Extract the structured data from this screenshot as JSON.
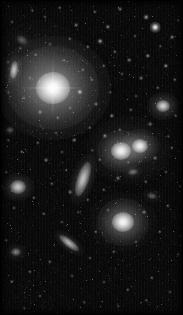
{
  "image": {
    "kind": "astronomical-deep-sky-image",
    "title": "Galaxy cluster field",
    "width": 183,
    "height": 315,
    "color_mode": "grayscale",
    "background_color": "#050505",
    "light_color": "#ffffff",
    "border_color": "#000000",
    "orientation_note": "dense stellar field with several extended galaxies"
  },
  "intracluster_light": [
    {
      "name": "halo-around-dominant-galaxy",
      "cx": 53,
      "cy": 88,
      "rx": 58,
      "ry": 52,
      "peak": 0.3
    },
    {
      "name": "halo-around-galaxy-pair",
      "cx": 128,
      "cy": 150,
      "rx": 42,
      "ry": 34,
      "peak": 0.15
    },
    {
      "name": "halo-around-lower-elliptical",
      "cx": 123,
      "cy": 222,
      "rx": 34,
      "ry": 30,
      "peak": 0.13
    },
    {
      "name": "diffuse-upper-left-glow",
      "cx": 40,
      "cy": 60,
      "rx": 48,
      "ry": 40,
      "peak": 0.07
    }
  ],
  "galaxies": [
    {
      "name": "dominant-elliptical-galaxy",
      "type": "elliptical",
      "cx": 53,
      "cy": 88,
      "rx": 17,
      "ry": 16,
      "angle": 0,
      "brightness": 1.0,
      "halo_rx": 46,
      "halo_ry": 42,
      "spikes": true
    },
    {
      "name": "elliptical-galaxy-center-left-pair",
      "type": "elliptical",
      "cx": 121,
      "cy": 151,
      "rx": 10,
      "ry": 9,
      "angle": 0,
      "brightness": 0.9,
      "halo_rx": 24,
      "halo_ry": 21,
      "spikes": false
    },
    {
      "name": "elliptical-galaxy-center-right-pair",
      "type": "elliptical",
      "cx": 140,
      "cy": 146,
      "rx": 8,
      "ry": 7,
      "angle": 0,
      "brightness": 0.86,
      "halo_rx": 19,
      "halo_ry": 17,
      "spikes": false
    },
    {
      "name": "elliptical-galaxy-lower-center",
      "type": "elliptical",
      "cx": 123,
      "cy": 222,
      "rx": 11,
      "ry": 10,
      "angle": 0,
      "brightness": 0.92,
      "halo_rx": 26,
      "halo_ry": 24,
      "spikes": false
    },
    {
      "name": "edge-on-spiral-galaxy-center",
      "type": "edge-on-spiral",
      "cx": 83,
      "cy": 179,
      "rx": 6,
      "ry": 18,
      "angle": 18,
      "brightness": 0.62,
      "halo_rx": 12,
      "halo_ry": 26,
      "spikes": false
    },
    {
      "name": "lenticular-galaxy-left-mid",
      "type": "lenticular",
      "cx": 18,
      "cy": 187,
      "rx": 8,
      "ry": 7,
      "angle": 0,
      "brightness": 0.64,
      "halo_rx": 16,
      "halo_ry": 14,
      "spikes": false
    },
    {
      "name": "edge-on-galaxy-upper-left",
      "type": "edge-on-spiral",
      "cx": 14,
      "cy": 70,
      "rx": 4,
      "ry": 9,
      "angle": 8,
      "brightness": 0.58,
      "halo_rx": 8,
      "halo_ry": 16,
      "spikes": false
    },
    {
      "name": "streak-galaxy-lower-left",
      "type": "edge-on-spiral",
      "cx": 69,
      "cy": 243,
      "rx": 4,
      "ry": 12,
      "angle": -52,
      "brightness": 0.55,
      "halo_rx": 8,
      "halo_ry": 18,
      "spikes": false
    },
    {
      "name": "elliptical-galaxy-right-upper",
      "type": "elliptical",
      "cx": 163,
      "cy": 106,
      "rx": 7,
      "ry": 6,
      "angle": 0,
      "brightness": 0.7,
      "halo_rx": 16,
      "halo_ry": 14,
      "spikes": false
    },
    {
      "name": "faint-galaxy-upper-left-edge",
      "type": "spiral",
      "cx": 22,
      "cy": 40,
      "rx": 6,
      "ry": 4,
      "angle": 30,
      "brightness": 0.22,
      "halo_rx": 11,
      "halo_ry": 8,
      "spikes": false
    },
    {
      "name": "faint-galaxy-mid-left",
      "type": "elliptical",
      "cx": 10,
      "cy": 130,
      "rx": 4,
      "ry": 3,
      "angle": 0,
      "brightness": 0.2,
      "halo_rx": 8,
      "halo_ry": 7,
      "spikes": false
    },
    {
      "name": "faint-galaxy-lower-right",
      "type": "elliptical",
      "cx": 152,
      "cy": 196,
      "rx": 5,
      "ry": 3,
      "angle": 12,
      "brightness": 0.24,
      "halo_rx": 10,
      "halo_ry": 7,
      "spikes": false
    },
    {
      "name": "faint-galaxy-bottom-left",
      "type": "elliptical",
      "cx": 16,
      "cy": 252,
      "rx": 5,
      "ry": 4,
      "angle": 0,
      "brightness": 0.34,
      "halo_rx": 10,
      "halo_ry": 9,
      "spikes": false
    },
    {
      "name": "faint-galaxy-right-mid",
      "type": "elliptical",
      "cx": 133,
      "cy": 172,
      "rx": 5,
      "ry": 3,
      "angle": -10,
      "brightness": 0.3,
      "halo_rx": 10,
      "halo_ry": 7,
      "spikes": false
    }
  ],
  "stars": [
    {
      "cx": 155,
      "cy": 27,
      "r": 2.4,
      "b": 0.95
    },
    {
      "cx": 146,
      "cy": 17,
      "r": 1.3,
      "b": 0.55
    },
    {
      "cx": 172,
      "cy": 37,
      "r": 1.1,
      "b": 0.45
    },
    {
      "cx": 120,
      "cy": 9,
      "r": 1.1,
      "b": 0.4
    },
    {
      "cx": 95,
      "cy": 12,
      "r": 1.0,
      "b": 0.35
    },
    {
      "cx": 60,
      "cy": 8,
      "r": 1.0,
      "b": 0.38
    },
    {
      "cx": 45,
      "cy": 17,
      "r": 0.9,
      "b": 0.3
    },
    {
      "cx": 32,
      "cy": 10,
      "r": 0.8,
      "b": 0.26
    },
    {
      "cx": 12,
      "cy": 22,
      "r": 0.9,
      "b": 0.3
    },
    {
      "cx": 76,
      "cy": 25,
      "r": 1.1,
      "b": 0.42
    },
    {
      "cx": 108,
      "cy": 27,
      "r": 1.2,
      "b": 0.48
    },
    {
      "cx": 135,
      "cy": 36,
      "r": 0.9,
      "b": 0.3
    },
    {
      "cx": 100,
      "cy": 41,
      "r": 1.3,
      "b": 0.55
    },
    {
      "cx": 88,
      "cy": 47,
      "r": 1.0,
      "b": 0.38
    },
    {
      "cx": 70,
      "cy": 39,
      "r": 1.0,
      "b": 0.36
    },
    {
      "cx": 50,
      "cy": 44,
      "r": 0.9,
      "b": 0.28
    },
    {
      "cx": 36,
      "cy": 55,
      "r": 1.0,
      "b": 0.34
    },
    {
      "cx": 20,
      "cy": 48,
      "r": 0.8,
      "b": 0.26
    },
    {
      "cx": 8,
      "cy": 62,
      "r": 0.9,
      "b": 0.28
    },
    {
      "cx": 115,
      "cy": 52,
      "r": 1.0,
      "b": 0.38
    },
    {
      "cx": 129,
      "cy": 60,
      "r": 1.1,
      "b": 0.42
    },
    {
      "cx": 148,
      "cy": 56,
      "r": 1.2,
      "b": 0.5
    },
    {
      "cx": 166,
      "cy": 66,
      "r": 1.2,
      "b": 0.52
    },
    {
      "cx": 175,
      "cy": 80,
      "r": 1.0,
      "b": 0.36
    },
    {
      "cx": 158,
      "cy": 88,
      "r": 1.0,
      "b": 0.34
    },
    {
      "cx": 141,
      "cy": 78,
      "r": 1.1,
      "b": 0.4
    },
    {
      "cx": 122,
      "cy": 74,
      "r": 0.9,
      "b": 0.3
    },
    {
      "cx": 104,
      "cy": 66,
      "r": 1.0,
      "b": 0.34
    },
    {
      "cx": 92,
      "cy": 80,
      "r": 1.0,
      "b": 0.34
    },
    {
      "cx": 80,
      "cy": 92,
      "r": 1.4,
      "b": 0.62
    },
    {
      "cx": 83,
      "cy": 70,
      "r": 1.0,
      "b": 0.33
    },
    {
      "cx": 30,
      "cy": 78,
      "r": 0.9,
      "b": 0.28
    },
    {
      "cx": 24,
      "cy": 98,
      "r": 0.9,
      "b": 0.28
    },
    {
      "cx": 8,
      "cy": 92,
      "r": 0.8,
      "b": 0.24
    },
    {
      "cx": 40,
      "cy": 112,
      "r": 1.1,
      "b": 0.42
    },
    {
      "cx": 58,
      "cy": 118,
      "r": 1.0,
      "b": 0.34
    },
    {
      "cx": 70,
      "cy": 108,
      "r": 0.9,
      "b": 0.3
    },
    {
      "cx": 96,
      "cy": 104,
      "r": 1.1,
      "b": 0.4
    },
    {
      "cx": 112,
      "cy": 116,
      "r": 1.2,
      "b": 0.46
    },
    {
      "cx": 131,
      "cy": 110,
      "r": 1.0,
      "b": 0.34
    },
    {
      "cx": 176,
      "cy": 116,
      "r": 1.0,
      "b": 0.36
    },
    {
      "cx": 150,
      "cy": 124,
      "r": 1.1,
      "b": 0.4
    },
    {
      "cx": 120,
      "cy": 130,
      "r": 1.0,
      "b": 0.36
    },
    {
      "cx": 105,
      "cy": 136,
      "r": 1.2,
      "b": 0.48
    },
    {
      "cx": 90,
      "cy": 128,
      "r": 1.0,
      "b": 0.34
    },
    {
      "cx": 74,
      "cy": 140,
      "r": 1.1,
      "b": 0.4
    },
    {
      "cx": 56,
      "cy": 133,
      "r": 0.9,
      "b": 0.3
    },
    {
      "cx": 38,
      "cy": 143,
      "r": 1.0,
      "b": 0.34
    },
    {
      "cx": 22,
      "cy": 152,
      "r": 1.0,
      "b": 0.36
    },
    {
      "cx": 8,
      "cy": 140,
      "r": 0.8,
      "b": 0.24
    },
    {
      "cx": 46,
      "cy": 160,
      "r": 1.1,
      "b": 0.42
    },
    {
      "cx": 62,
      "cy": 152,
      "r": 0.9,
      "b": 0.3
    },
    {
      "cx": 100,
      "cy": 160,
      "r": 1.0,
      "b": 0.34
    },
    {
      "cx": 155,
      "cy": 158,
      "r": 1.1,
      "b": 0.4
    },
    {
      "cx": 172,
      "cy": 148,
      "r": 1.0,
      "b": 0.34
    },
    {
      "cx": 166,
      "cy": 172,
      "r": 0.9,
      "b": 0.3
    },
    {
      "cx": 146,
      "cy": 182,
      "r": 1.0,
      "b": 0.34
    },
    {
      "cx": 118,
      "cy": 178,
      "r": 1.1,
      "b": 0.42
    },
    {
      "cx": 104,
      "cy": 190,
      "r": 1.0,
      "b": 0.36
    },
    {
      "cx": 88,
      "cy": 200,
      "r": 1.0,
      "b": 0.34
    },
    {
      "cx": 70,
      "cy": 192,
      "r": 1.1,
      "b": 0.4
    },
    {
      "cx": 52,
      "cy": 184,
      "r": 1.0,
      "b": 0.34
    },
    {
      "cx": 34,
      "cy": 198,
      "r": 1.0,
      "b": 0.34
    },
    {
      "cx": 14,
      "cy": 208,
      "r": 0.9,
      "b": 0.3
    },
    {
      "cx": 44,
      "cy": 214,
      "r": 1.0,
      "b": 0.36
    },
    {
      "cx": 62,
      "cy": 222,
      "r": 0.9,
      "b": 0.3
    },
    {
      "cx": 96,
      "cy": 232,
      "r": 1.0,
      "b": 0.34
    },
    {
      "cx": 144,
      "cy": 212,
      "r": 1.1,
      "b": 0.4
    },
    {
      "cx": 168,
      "cy": 206,
      "r": 1.0,
      "b": 0.34
    },
    {
      "cx": 160,
      "cy": 232,
      "r": 1.0,
      "b": 0.36
    },
    {
      "cx": 136,
      "cy": 242,
      "r": 0.9,
      "b": 0.3
    },
    {
      "cx": 114,
      "cy": 252,
      "r": 1.0,
      "b": 0.34
    },
    {
      "cx": 90,
      "cy": 258,
      "r": 0.9,
      "b": 0.3
    },
    {
      "cx": 50,
      "cy": 262,
      "r": 1.0,
      "b": 0.34
    },
    {
      "cx": 30,
      "cy": 272,
      "r": 1.0,
      "b": 0.36
    },
    {
      "cx": 12,
      "cy": 282,
      "r": 1.0,
      "b": 0.38
    },
    {
      "cx": 72,
      "cy": 276,
      "r": 0.9,
      "b": 0.28
    },
    {
      "cx": 104,
      "cy": 282,
      "r": 0.9,
      "b": 0.28
    },
    {
      "cx": 128,
      "cy": 290,
      "r": 1.0,
      "b": 0.32
    },
    {
      "cx": 152,
      "cy": 278,
      "r": 1.0,
      "b": 0.34
    },
    {
      "cx": 170,
      "cy": 292,
      "r": 0.9,
      "b": 0.28
    },
    {
      "cx": 40,
      "cy": 296,
      "r": 0.9,
      "b": 0.28
    },
    {
      "cx": 84,
      "cy": 302,
      "r": 0.8,
      "b": 0.24
    },
    {
      "cx": 118,
      "cy": 306,
      "r": 0.8,
      "b": 0.22
    },
    {
      "cx": 146,
      "cy": 300,
      "r": 0.8,
      "b": 0.24
    },
    {
      "cx": 24,
      "cy": 308,
      "r": 0.8,
      "b": 0.22
    },
    {
      "cx": 64,
      "cy": 60,
      "r": 0.8,
      "b": 0.26
    },
    {
      "cx": 110,
      "cy": 92,
      "r": 0.8,
      "b": 0.26
    },
    {
      "cx": 136,
      "cy": 96,
      "r": 0.9,
      "b": 0.28
    },
    {
      "cx": 168,
      "cy": 136,
      "r": 0.8,
      "b": 0.26
    },
    {
      "cx": 128,
      "cy": 162,
      "r": 0.8,
      "b": 0.26
    },
    {
      "cx": 78,
      "cy": 212,
      "r": 0.8,
      "b": 0.24
    },
    {
      "cx": 108,
      "cy": 210,
      "r": 0.9,
      "b": 0.3
    },
    {
      "cx": 180,
      "cy": 186,
      "r": 0.8,
      "b": 0.24
    },
    {
      "cx": 6,
      "cy": 172,
      "r": 0.8,
      "b": 0.24
    },
    {
      "cx": 6,
      "cy": 240,
      "r": 0.8,
      "b": 0.24
    },
    {
      "cx": 178,
      "cy": 254,
      "r": 0.8,
      "b": 0.24
    },
    {
      "cx": 92,
      "cy": 150,
      "r": 0.8,
      "b": 0.26
    },
    {
      "cx": 66,
      "cy": 170,
      "r": 0.8,
      "b": 0.24
    },
    {
      "cx": 160,
      "cy": 46,
      "r": 0.8,
      "b": 0.24
    },
    {
      "cx": 178,
      "cy": 20,
      "r": 0.8,
      "b": 0.24
    }
  ]
}
